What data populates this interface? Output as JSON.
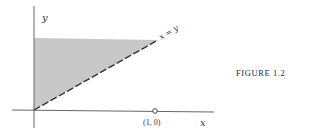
{
  "figure": {
    "caption": "FIGURE 1.2",
    "axes": {
      "x_label": "x",
      "y_label": "y"
    },
    "line_label": "x = y",
    "point_label": "(1, 0)",
    "colors": {
      "shaded_region": "#c8c8c8",
      "axes": "#555555",
      "line": "#333333"
    }
  }
}
